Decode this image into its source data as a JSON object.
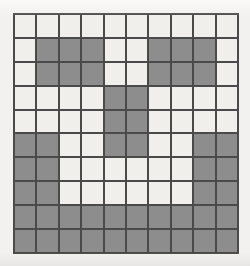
{
  "figure": {
    "name": "binary-grid-pattern",
    "type": "grid",
    "rows": 10,
    "columns": 10,
    "legend": {
      "dark_value": 1,
      "light_value": 0
    },
    "colors": {
      "dark_cell": "#8d8d8d",
      "light_cell": "#f0efec",
      "grid_line": "#4a4a4a",
      "background": "#f2f1ef"
    },
    "matrix": [
      [
        0,
        0,
        0,
        0,
        0,
        0,
        0,
        0,
        0,
        0
      ],
      [
        0,
        1,
        1,
        1,
        0,
        0,
        1,
        1,
        1,
        0
      ],
      [
        0,
        1,
        1,
        1,
        0,
        0,
        1,
        1,
        1,
        0
      ],
      [
        0,
        0,
        0,
        0,
        1,
        1,
        0,
        0,
        0,
        0
      ],
      [
        0,
        0,
        0,
        0,
        1,
        1,
        0,
        0,
        0,
        0
      ],
      [
        1,
        1,
        0,
        0,
        1,
        1,
        0,
        0,
        1,
        1
      ],
      [
        1,
        1,
        0,
        0,
        0,
        0,
        0,
        0,
        1,
        1
      ],
      [
        1,
        1,
        0,
        0,
        0,
        0,
        0,
        0,
        1,
        1
      ],
      [
        1,
        1,
        1,
        1,
        1,
        1,
        1,
        1,
        1,
        1
      ],
      [
        1,
        1,
        1,
        1,
        1,
        1,
        1,
        1,
        1,
        1
      ]
    ]
  }
}
